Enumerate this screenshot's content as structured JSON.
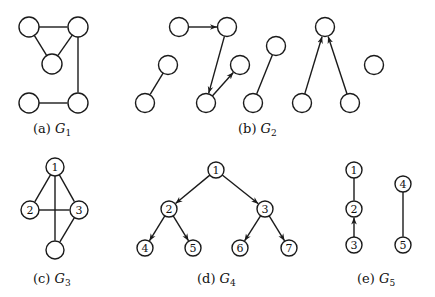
{
  "figure": {
    "graphs": [
      {
        "id": "G1",
        "caption_prefix": "(a)",
        "caption_name": "G",
        "caption_sub": "1",
        "directed": false,
        "nodes": [
          {
            "id": "a",
            "label": ""
          },
          {
            "id": "b",
            "label": ""
          },
          {
            "id": "c",
            "label": ""
          },
          {
            "id": "d",
            "label": ""
          },
          {
            "id": "e",
            "label": ""
          }
        ],
        "edges": [
          {
            "from": "a",
            "to": "b"
          },
          {
            "from": "a",
            "to": "c"
          },
          {
            "from": "b",
            "to": "c"
          },
          {
            "from": "b",
            "to": "e"
          },
          {
            "from": "d",
            "to": "e"
          }
        ]
      },
      {
        "id": "G2",
        "caption_prefix": "(b)",
        "caption_name": "G",
        "caption_sub": "2",
        "directed": true,
        "nodes": [
          {
            "id": "p",
            "label": ""
          },
          {
            "id": "q",
            "label": ""
          },
          {
            "id": "r",
            "label": ""
          },
          {
            "id": "s",
            "label": ""
          },
          {
            "id": "t",
            "label": ""
          },
          {
            "id": "u",
            "label": ""
          },
          {
            "id": "v",
            "label": ""
          },
          {
            "id": "w",
            "label": ""
          },
          {
            "id": "x",
            "label": ""
          },
          {
            "id": "y",
            "label": ""
          },
          {
            "id": "z",
            "label": ""
          },
          {
            "id": "iso",
            "label": ""
          }
        ],
        "edges": [
          {
            "from": "p",
            "to": "q",
            "arrow": true
          },
          {
            "from": "q",
            "to": "r",
            "arrow": true
          },
          {
            "from": "r",
            "to": "s",
            "arrow": true
          },
          {
            "from": "t",
            "to": "u",
            "arrow": false
          },
          {
            "from": "v",
            "to": "w",
            "arrow": false
          },
          {
            "from": "x",
            "to": "y",
            "arrow": true
          },
          {
            "from": "z",
            "to": "y",
            "arrow": true
          }
        ]
      },
      {
        "id": "G3",
        "caption_prefix": "(c)",
        "caption_name": "G",
        "caption_sub": "3",
        "directed": false,
        "nodes": [
          {
            "id": "1",
            "label": "1"
          },
          {
            "id": "2",
            "label": "2"
          },
          {
            "id": "3",
            "label": "3"
          },
          {
            "id": "4",
            "label": ""
          }
        ],
        "edges": [
          {
            "from": "1",
            "to": "2"
          },
          {
            "from": "1",
            "to": "3"
          },
          {
            "from": "1",
            "to": "4"
          },
          {
            "from": "2",
            "to": "3"
          },
          {
            "from": "3",
            "to": "4"
          }
        ]
      },
      {
        "id": "G4",
        "caption_prefix": "(d)",
        "caption_name": "G",
        "caption_sub": "4",
        "directed": true,
        "nodes": [
          {
            "id": "1",
            "label": "1"
          },
          {
            "id": "2",
            "label": "2"
          },
          {
            "id": "3",
            "label": "3"
          },
          {
            "id": "4",
            "label": "4"
          },
          {
            "id": "5",
            "label": "5"
          },
          {
            "id": "6",
            "label": "6"
          },
          {
            "id": "7",
            "label": "7"
          }
        ],
        "edges": [
          {
            "from": "1",
            "to": "2",
            "arrow": true
          },
          {
            "from": "1",
            "to": "3",
            "arrow": true
          },
          {
            "from": "2",
            "to": "4",
            "arrow": true
          },
          {
            "from": "2",
            "to": "5",
            "arrow": true
          },
          {
            "from": "3",
            "to": "6",
            "arrow": true
          },
          {
            "from": "3",
            "to": "7",
            "arrow": true
          }
        ]
      },
      {
        "id": "G5",
        "caption_prefix": "(e)",
        "caption_name": "G",
        "caption_sub": "5",
        "directed": true,
        "nodes": [
          {
            "id": "1",
            "label": "1"
          },
          {
            "id": "2",
            "label": "2"
          },
          {
            "id": "3",
            "label": "3"
          },
          {
            "id": "4",
            "label": "4"
          },
          {
            "id": "5",
            "label": "5"
          }
        ],
        "edges": [
          {
            "from": "1",
            "to": "2",
            "arrow": false
          },
          {
            "from": "3",
            "to": "2",
            "arrow": true
          },
          {
            "from": "4",
            "to": "5",
            "arrow": false
          }
        ]
      }
    ]
  }
}
